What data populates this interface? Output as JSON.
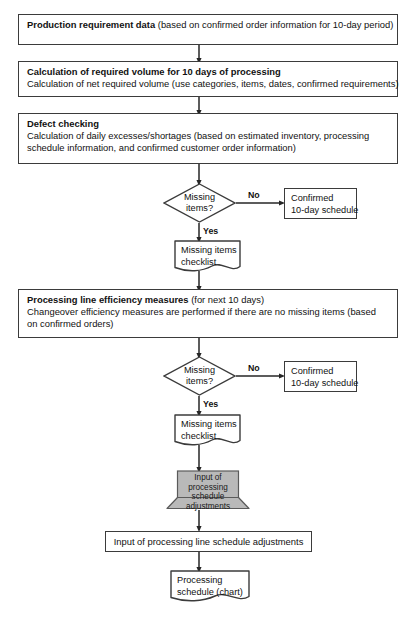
{
  "diagram": {
    "type": "flowchart",
    "colors": {
      "stroke": "#3b3b3b",
      "fill": "#ffffff",
      "manual_input_fill": "#b9b9b9",
      "text": "#111111"
    }
  },
  "nodes": {
    "production_requirement": {
      "shape": "process",
      "title": "Production requirement data",
      "detail": " (based on confirmed order information for 10-day period)"
    },
    "calculation_volume": {
      "shape": "process",
      "title": "Calculation of required volume for 10 days of processing",
      "line2": "Calculation of net required volume (use categories, items, dates, confirmed requirements)"
    },
    "defect_checking": {
      "shape": "process",
      "title": "Defect checking",
      "line2": "Calculation of daily excesses/shortages (based on estimated inventory, processing",
      "line3": "schedule information, and confirmed customer order information)"
    },
    "decision_1": {
      "shape": "decision",
      "line1": "Missing",
      "line2": "items?"
    },
    "confirmed_schedule_1": {
      "shape": "process",
      "line1": "Confirmed",
      "line2": "10-day schedule"
    },
    "missing_items_checklist_1": {
      "shape": "document",
      "line1": "Missing items",
      "line2": "checklist"
    },
    "processing_line_efficiency": {
      "shape": "process",
      "title": "Processing line efficiency measures",
      "detail": " (for next 10 days)",
      "line2": "Changeover efficiency measures are performed if there are no missing items (based",
      "line3": "on confirmed orders)"
    },
    "decision_2": {
      "shape": "decision",
      "line1": "Missing",
      "line2": "items?"
    },
    "confirmed_schedule_2": {
      "shape": "process",
      "line1": "Confirmed",
      "line2": "10-day schedule"
    },
    "missing_items_checklist_2": {
      "shape": "document",
      "line1": "Missing items",
      "line2": "checklist"
    },
    "input_schedule_adjustments": {
      "shape": "manual-input",
      "line1": "Input of",
      "line2": "processing",
      "line3": "schedule",
      "line4": "adjustments"
    },
    "input_line_schedule_adjustments": {
      "shape": "process",
      "label": "Input of processing line schedule adjustments"
    },
    "processing_schedule_chart": {
      "shape": "document",
      "line1": "Processing",
      "line2": "schedule (chart)"
    }
  },
  "edge_labels": {
    "no_1": "No",
    "yes_1": "Yes",
    "no_2": "No",
    "yes_2": "Yes"
  }
}
